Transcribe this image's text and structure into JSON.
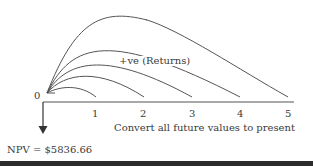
{
  "diagram": {
    "origin_label": "0",
    "ticks": [
      "1",
      "2",
      "3",
      "4",
      "5"
    ],
    "returns_label": "+ve (Returns)",
    "axis_caption": "Convert all future values to present",
    "npv_label": "NPV = $5836.66",
    "line_color": "#555555",
    "bar_color": "#2b2b2b"
  }
}
